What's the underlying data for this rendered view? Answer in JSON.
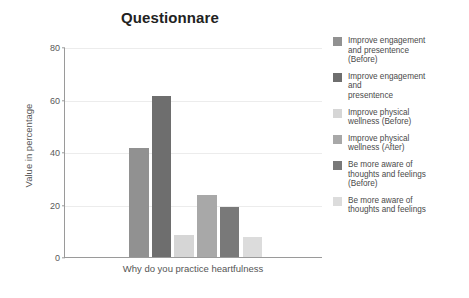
{
  "chart_data": {
    "type": "bar",
    "title": "Questionnare",
    "xlabel": "Why do you practice heartfulness",
    "ylabel": "Value in percentage",
    "ylim": [
      0,
      80
    ],
    "yticks": [
      0,
      20,
      40,
      60,
      80
    ],
    "grid": true,
    "legend_position": "right",
    "categories": [
      "Why do you practice heartfulness"
    ],
    "series": [
      {
        "name": "Improve engagement\n and presentence\n(Before)",
        "values": [
          41.5
        ],
        "color": "#919191"
      },
      {
        "name": "Improve engagement\nand\npresentence",
        "values": [
          61.5
        ],
        "color": "#6e6e6e"
      },
      {
        "name": "Improve physical\nwellness (Before)",
        "values": [
          8.5
        ],
        "color": "#d6d6d6"
      },
      {
        "name": "Improve physical\nwellness  (After)",
        "values": [
          23.5
        ],
        "color": "#a8a8a8"
      },
      {
        "name": "Be more aware of\nthoughts and feelings\n(Before)",
        "values": [
          19.0
        ],
        "color": "#797979"
      },
      {
        "name": "Be more aware of\nthoughts and feelings",
        "values": [
          7.5
        ],
        "color": "#dcdcdc"
      }
    ]
  },
  "axis": {
    "tick_0": "0",
    "tick_20": "20",
    "tick_40": "40",
    "tick_60": "60",
    "tick_80": "80"
  },
  "legend": {
    "items": [
      {
        "label": "Improve engagement\n and presentence\n(Before)",
        "color": "#919191"
      },
      {
        "label": "Improve engagement\nand\npresentence",
        "color": "#6e6e6e"
      },
      {
        "label": "Improve physical\nwellness (Before)",
        "color": "#d6d6d6"
      },
      {
        "label": "Improve physical\nwellness  (After)",
        "color": "#a8a8a8"
      },
      {
        "label": "Be more aware of\nthoughts and feelings\n(Before)",
        "color": "#797979"
      },
      {
        "label": "Be more aware of\nthoughts and feelings",
        "color": "#dcdcdc"
      }
    ]
  },
  "colors": {
    "axis": "#9a9a9a",
    "grid": "#ececec",
    "text": "#4a4a4a",
    "title": "#222222",
    "background": "#ffffff"
  }
}
